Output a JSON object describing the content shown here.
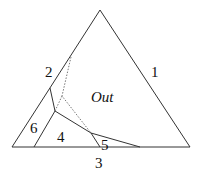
{
  "diagram": {
    "type": "ternary-phase-diagram",
    "stroke_color": "#333333",
    "triangle": {
      "apex": [
        100,
        10
      ],
      "bottom_left": [
        12,
        147
      ],
      "bottom_right": [
        190,
        147
      ]
    },
    "labels": {
      "side_1": "1",
      "side_2": "2",
      "side_3": "3",
      "region_out": "Out",
      "region_4": "4",
      "region_5": "5",
      "region_6": "6"
    }
  }
}
